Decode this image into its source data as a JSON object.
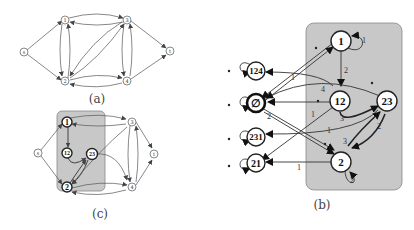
{
  "panels": {
    "a": {
      "caption": "(a)",
      "nodes": [
        "s",
        "1",
        "2",
        "3",
        "4",
        "t"
      ]
    },
    "b": {
      "caption": "(b)",
      "inner_nodes": [
        "1",
        "12",
        "23",
        "2"
      ],
      "outer_nodes": [
        "124",
        "∅",
        "231",
        "21"
      ],
      "edge_labels": {
        "self_1": "1",
        "n1_to_12": "2",
        "e_4": "4",
        "e_1_upper": "1",
        "e_2_empty": "2",
        "e_1_left": "1",
        "e_3_12_23": "3",
        "e_1_231": "1",
        "e_2_23_2": "2",
        "e_3_2_23": "3",
        "e_1_21": "1",
        "self_2": "2"
      }
    },
    "c": {
      "caption": "(c)",
      "nodes": [
        "s",
        "1",
        "12",
        "23",
        "2",
        "3",
        "4",
        "t"
      ]
    }
  }
}
